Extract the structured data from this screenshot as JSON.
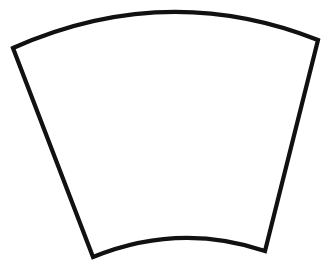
{
  "document": {
    "title": "Annulus Sector Outline",
    "kind": "line-drawing",
    "background_color": "#FFFFFF",
    "width": 329,
    "height": 266
  },
  "shape": {
    "name": "annulus-sector",
    "description": "Fan / trapezoid-like quadrilateral with two curved horizontal edges and two straight slanted sides",
    "fill_color": "#FFFFFF",
    "stroke_color": "#111111",
    "stroke_width": 4.2,
    "vertices": {
      "top_left": {
        "x": 13,
        "y": 48
      },
      "top_right": {
        "x": 318,
        "y": 40
      },
      "bottom_right": {
        "x": 265,
        "y": 251
      },
      "bottom_left": {
        "x": 93,
        "y": 257
      }
    },
    "edges": [
      {
        "name": "top-arc",
        "curve": "convex-up",
        "control": {
          "x": 166,
          "y": -20
        }
      },
      {
        "name": "right-side",
        "curve": "straight"
      },
      {
        "name": "bottom-arc",
        "curve": "convex-down",
        "control": {
          "x": 179,
          "y": 222
        }
      },
      {
        "name": "left-side",
        "curve": "straight"
      }
    ],
    "path_d": "M 13 48 Q 166 -20 318 40 L 265 251 Q 179 222 93 257 Z"
  }
}
